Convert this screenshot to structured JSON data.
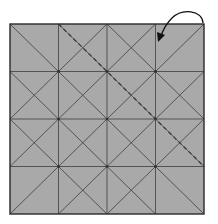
{
  "diagram": {
    "type": "origami-crease-pattern",
    "colors": {
      "paper": "#a9a9a9",
      "crease": "#4a4a4a",
      "edge": "#2a2a2a",
      "dashed_fold": "#3a3a3a",
      "arrow": "#111111",
      "background": "#ffffff"
    },
    "grid": {
      "rows": 4,
      "cols": 4
    },
    "square": {
      "x": 10,
      "y": 24,
      "width": 194,
      "height": 190
    },
    "fold_line": {
      "style": "dashed",
      "from": "top edge, 1/4 from left",
      "to": "right edge, 3/4 from top"
    },
    "arrow": {
      "from": "top-right corner",
      "to": "point on top-right cell inner area",
      "kind": "curved-fold-arrow"
    }
  }
}
